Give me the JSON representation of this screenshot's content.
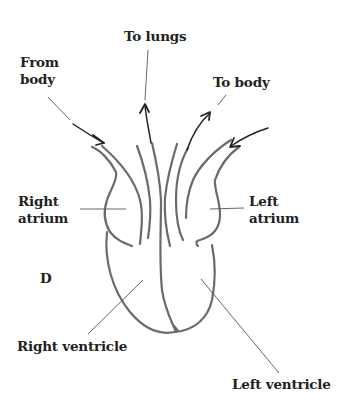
{
  "diagram": {
    "figure_letter": "D",
    "labels": {
      "to_lungs": "To lungs",
      "from_body": [
        "From",
        "body"
      ],
      "to_body": "To body",
      "right_atrium": [
        "Right",
        "atrium"
      ],
      "left_atrium": [
        "Left",
        "atrium"
      ],
      "right_ventricle": "Right ventricle",
      "left_ventricle": "Left ventricle"
    },
    "flows": [
      {
        "name": "from-body",
        "direction": "into right atrium"
      },
      {
        "name": "to-lungs",
        "direction": "out of right ventricle"
      },
      {
        "name": "to-body",
        "direction": "out of left ventricle"
      },
      {
        "name": "from-lungs",
        "direction": "into left atrium"
      }
    ],
    "colors": {
      "heart_outline": "#6b6b6b",
      "arrows": "#222222",
      "text": "#222222",
      "background": "#ffffff"
    }
  }
}
